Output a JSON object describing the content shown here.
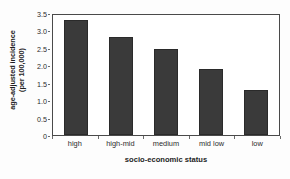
{
  "chart_data": {
    "type": "bar",
    "title": "",
    "categories": [
      "high",
      "high-mid",
      "medium",
      "mid low",
      "low"
    ],
    "values": [
      3.3,
      2.8,
      2.45,
      1.88,
      1.3
    ],
    "xlabel": "socio-economic status",
    "ylabel_line1": "age-adjusted incidence",
    "ylabel_line2": "(per 100,000)",
    "ylabel": "age-adjusted incidence (per 100,000)",
    "ylim": [
      0,
      3.5
    ],
    "yticks": [
      "0",
      "0.5",
      "1.0",
      "1.5",
      "2.0",
      "2.5",
      "3.0",
      "3.5"
    ],
    "ytick_values": [
      0,
      0.5,
      1.0,
      1.5,
      2.0,
      2.5,
      3.0,
      3.5
    ],
    "grid": false,
    "legend": "none",
    "bar_color": "#3a3a3a",
    "frame_color": "#4a4a4a",
    "background": "#ffffff"
  }
}
